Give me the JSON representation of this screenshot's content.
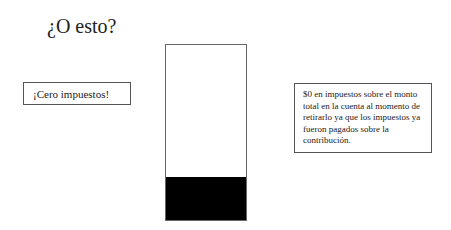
{
  "title": "¿O esto?",
  "left_label": "¡Cero impuestos!",
  "right_note": "$0 en impuestos sobre el monto total en la cuenta al momento de retirarlo ya que los impuestos ya fueron pagados sobre la contribución.",
  "bar": {
    "fill_color": "#000000",
    "fill_fraction": 0.24
  }
}
